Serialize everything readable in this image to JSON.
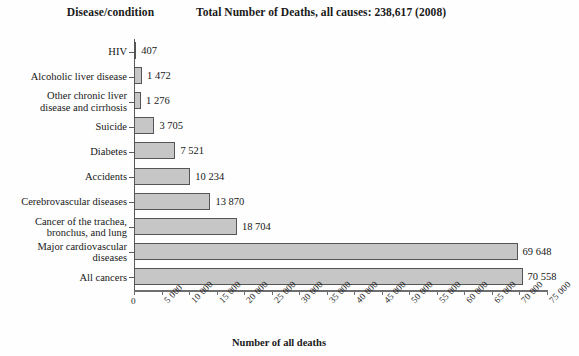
{
  "headers": {
    "category_column": "Disease/condition",
    "title": "Total Number of Deaths, all causes: 238,617 (2008)"
  },
  "axis": {
    "x_title": "Number of all deaths"
  },
  "chart_data": {
    "type": "bar",
    "orientation": "horizontal",
    "title": "Total Number of Deaths, all causes: 238,617 (2008)",
    "xlabel": "Number of all deaths",
    "ylabel": "Disease/condition",
    "xlim": [
      0,
      75000
    ],
    "xticks": [
      0,
      5000,
      10000,
      15000,
      20000,
      25000,
      30000,
      35000,
      40000,
      45000,
      50000,
      55000,
      60000,
      65000,
      70000,
      75000
    ],
    "xtick_labels": [
      "0",
      "5 000",
      "10 000",
      "15 000",
      "20 000",
      "25 000",
      "30 000",
      "35 000",
      "40 000",
      "45 000",
      "50 000",
      "55 000",
      "60 000",
      "65 000",
      "70 000",
      "75 000"
    ],
    "grid": false,
    "legend": false,
    "bar_color": "#c6c6c6",
    "bar_edge_color": "#555555",
    "categories": [
      "HIV",
      "Alcoholic liver disease",
      "Other chronic liver\ndisease and cirrhosis",
      "Suicide",
      "Diabetes",
      "Accidents",
      "Cerebrovascular diseases",
      "Cancer of the trachea,\nbronchus, and lung",
      "Major cardiovascular\ndiseases",
      "All cancers"
    ],
    "values": [
      407,
      1472,
      1276,
      3705,
      7521,
      10234,
      13870,
      18704,
      69648,
      70558
    ],
    "value_labels": [
      "407",
      "1 472",
      "1 276",
      "3 705",
      "7 521",
      "10 234",
      "13 870",
      "18 704",
      "69 648",
      "70 558"
    ],
    "total_deaths": "238,617",
    "year": "2008"
  }
}
